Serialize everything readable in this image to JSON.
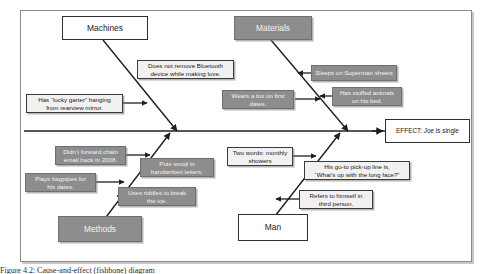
{
  "figure": {
    "type": "fishbone-ishikawa-diagram",
    "caption": "Figure 4.2: Cause-and-effect (fishbone) diagram"
  },
  "colors": {
    "spine": "#1f1f1f",
    "bone": "#1f1f1f",
    "gray_box_fill": "#8d8d8d",
    "white_box_fill": "#ffffff",
    "frame_border": "#8a8a8a",
    "text_dark": "#1a1a1a",
    "text_light": "#f2f2f2"
  },
  "effect": {
    "label": "EFFECT: Joe is single"
  },
  "categories": [
    {
      "id": "machines",
      "label": "Machines",
      "style": "white",
      "position": "top-left"
    },
    {
      "id": "materials",
      "label": "Materials",
      "style": "gray",
      "position": "top-right"
    },
    {
      "id": "methods",
      "label": "Methods",
      "style": "gray",
      "position": "bottom-left"
    },
    {
      "id": "man",
      "label": "Man",
      "style": "white",
      "position": "bottom-right"
    }
  ],
  "causes": [
    {
      "id": "bluetooth",
      "category": "machines",
      "text": "Does not remove Bluetooth\ndevice while making love.",
      "style": "light"
    },
    {
      "id": "lucky-garter",
      "category": "machines",
      "text": "Has “lucky garter” hanging\nfrom rearview mirror.",
      "style": "light"
    },
    {
      "id": "superman-sheets",
      "category": "materials",
      "text": "Sleeps on Superman sheets",
      "style": "gray"
    },
    {
      "id": "tux-first-dates",
      "category": "materials",
      "text": "Wears a tux on first\ndates.",
      "style": "gray"
    },
    {
      "id": "stuffed-animals",
      "category": "materials",
      "text": "Has stuffed animals\non his bed.",
      "style": "gray"
    },
    {
      "id": "chain-email",
      "category": "methods",
      "text": "Didn’t forward chain\nemail back in 2008.",
      "style": "gray"
    },
    {
      "id": "emoji-letters",
      "category": "methods",
      "text": "Puts emoji in\nhandwritten letters.",
      "style": "gray"
    },
    {
      "id": "bagpipes",
      "category": "methods",
      "text": "Plays bagpipes for\nhis dates.",
      "style": "gray"
    },
    {
      "id": "riddles",
      "category": "methods",
      "text": "Uses riddles to break\nthe ice.",
      "style": "gray"
    },
    {
      "id": "monthly-showers",
      "category": "man",
      "text": "Two words: monthly\nshowers",
      "style": "light"
    },
    {
      "id": "pickup-line",
      "category": "man",
      "text": "His go-to pick-up line is,\n“What’s up with the long face?”",
      "style": "light"
    },
    {
      "id": "third-person",
      "category": "man",
      "text": "Refers to himself in\nthird person.",
      "style": "light"
    }
  ]
}
